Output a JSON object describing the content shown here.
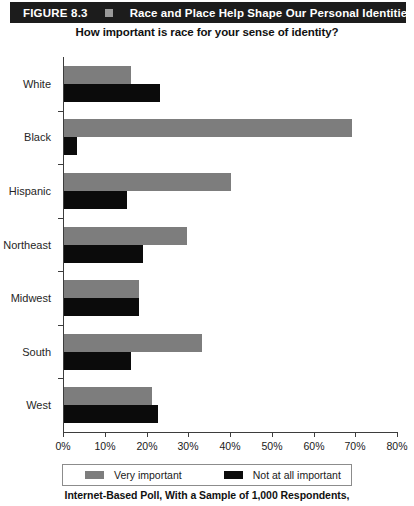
{
  "header": {
    "figure_number": "FIGURE 8.3",
    "marker_icon": "square-bullet-icon",
    "title": "Race and Place Help Shape Our Personal Identities",
    "bar_color": "#1c1c1c",
    "text_color": "#ffffff"
  },
  "subtitle": "How important is race for your sense of identity?",
  "caption": "Internet-Based Poll, With a Sample of 1,000 Respondents,",
  "legend": {
    "items": [
      {
        "label": "Very important",
        "color": "#7d7d7d",
        "swatch_icon": "gray-square-swatch"
      },
      {
        "label": "Not at all important",
        "color": "#0b0b0b",
        "swatch_icon": "black-square-swatch"
      }
    ]
  },
  "chart_data": {
    "type": "bar",
    "orientation": "horizontal",
    "title": "Race and Place Help Shape Our Personal Identities",
    "subtitle": "How important is race for your sense of identity?",
    "xlabel": "",
    "ylabel": "",
    "xlim": [
      0,
      80
    ],
    "xticks": [
      0,
      10,
      20,
      30,
      40,
      50,
      60,
      70,
      80
    ],
    "xtick_labels": [
      "0%",
      "10%",
      "20%",
      "30%",
      "40%",
      "50%",
      "60%",
      "70%",
      "80%"
    ],
    "grid": false,
    "legend_position": "below-axis",
    "categories": [
      "White",
      "Black",
      "Hispanic",
      "Northeast",
      "Midwest",
      "South",
      "West"
    ],
    "series": [
      {
        "name": "Very important",
        "color": "#7d7d7d",
        "values": [
          16,
          69,
          40,
          29.5,
          18,
          33,
          21
        ]
      },
      {
        "name": "Not at all important",
        "color": "#0b0b0b",
        "values": [
          23,
          3,
          15,
          19,
          18,
          16,
          22.5
        ]
      }
    ]
  }
}
